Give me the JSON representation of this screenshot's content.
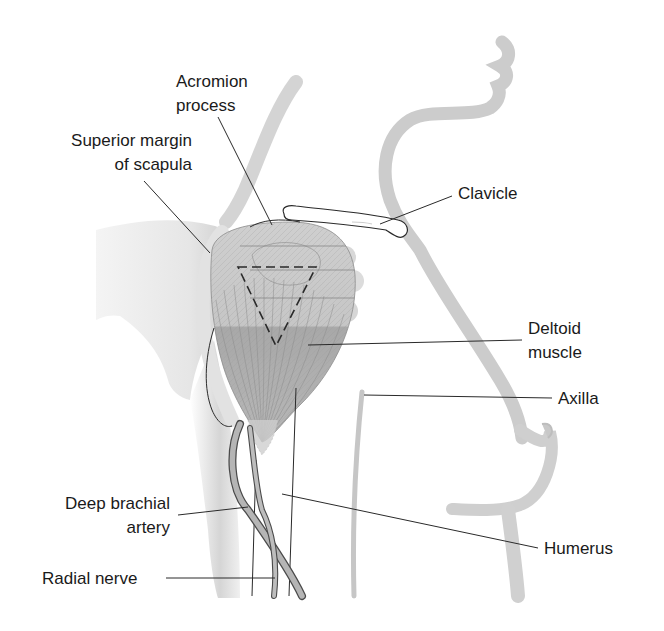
{
  "figure": {
    "type": "anatomical-diagram",
    "colors": {
      "background": "#ffffff",
      "text": "#1a1a1a",
      "leader_line": "#2a2a2a",
      "body_outline_shade": "#b8b8b8",
      "muscle_light": "#c9c9c9",
      "muscle_dark": "#a9a9a9",
      "vessel": "#9a9a9a"
    }
  },
  "labels": {
    "acromion": {
      "line1": "Acromion",
      "line2": "process",
      "x": 176,
      "y": 70,
      "align": "left",
      "leader": {
        "x1": 218,
        "y1": 117,
        "x2": 272,
        "y2": 225
      }
    },
    "superior_margin": {
      "line1": "Superior margin",
      "line2": "of scapula",
      "x": 40,
      "y": 129,
      "align": "right",
      "width": 152,
      "leader": {
        "x1": 144,
        "y1": 181,
        "x2": 210,
        "y2": 253
      }
    },
    "clavicle": {
      "line1": "Clavicle",
      "x": 458,
      "y": 182,
      "align": "left",
      "leader": {
        "x1": 452,
        "y1": 196,
        "x2": 380,
        "y2": 224
      }
    },
    "deltoid": {
      "line1": "Deltoid",
      "line2": "muscle",
      "x": 528,
      "y": 317,
      "align": "left",
      "leader": {
        "x1": 522,
        "y1": 340,
        "x2": 308,
        "y2": 345
      }
    },
    "axilla": {
      "line1": "Axilla",
      "x": 558,
      "y": 387,
      "align": "left",
      "leader": {
        "x1": 552,
        "y1": 398,
        "x2": 364,
        "y2": 395
      }
    },
    "humerus": {
      "line1": "Humerus",
      "x": 544,
      "y": 537,
      "align": "left",
      "leader": {
        "x1": 538,
        "y1": 548,
        "x2": 282,
        "y2": 494
      }
    },
    "deep_brachial_artery": {
      "line1": "Deep brachial",
      "line2": "artery",
      "x": 40,
      "y": 492,
      "align": "right",
      "width": 130,
      "leader": {
        "x1": 178,
        "y1": 515,
        "x2": 248,
        "y2": 507
      }
    },
    "radial_nerve": {
      "line1": "Radial nerve",
      "x": 42,
      "y": 567,
      "align": "left",
      "leader": {
        "x1": 166,
        "y1": 578,
        "x2": 275,
        "y2": 578
      }
    }
  }
}
